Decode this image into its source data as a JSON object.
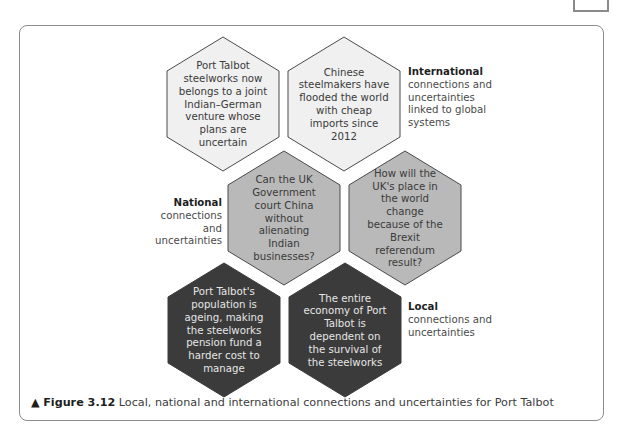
{
  "figure": {
    "marker": "▲",
    "number_label": "Figure 3.12",
    "caption": "Local, national and international connections and uncertainties for Port Talbot"
  },
  "hexagons": [
    {
      "level": "international",
      "shade": "light",
      "text": "Port Talbot steelworks now belongs to a joint Indian–German venture whose plans are uncertain"
    },
    {
      "level": "international",
      "shade": "light",
      "text": "Chinese steelmakers have flooded the world with cheap imports since 2012"
    },
    {
      "level": "national",
      "shade": "mid",
      "text": "Can the UK Government court China without alienating Indian businesses?"
    },
    {
      "level": "national",
      "shade": "mid",
      "text": "How will the UK's place in the world change because of the Brexit referendum result?"
    },
    {
      "level": "local",
      "shade": "dark",
      "text": "Port Talbot's population is ageing, making the steelworks pension fund a harder cost to manage"
    },
    {
      "level": "local",
      "shade": "dark",
      "text": "The entire economy of Port Talbot is dependent on the survival of the steelworks"
    }
  ],
  "labels": {
    "international": {
      "title": "International",
      "desc": "connections and uncertainties linked to global systems"
    },
    "national": {
      "title": "National",
      "desc": "connections and uncertainties"
    },
    "local": {
      "title": "Local",
      "desc": "connections and uncertainties"
    }
  },
  "colors": {
    "light_fill": "#f0f0f0",
    "mid_fill": "#b9b9b9",
    "dark_fill": "#3b3b3b",
    "stroke": "#4a4a4a"
  }
}
